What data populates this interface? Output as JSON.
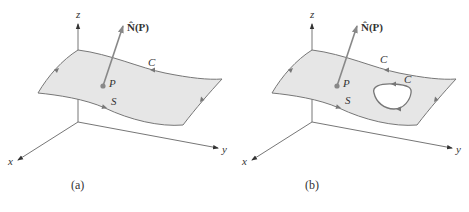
{
  "figures": [
    {
      "id": "a",
      "caption": "(a)",
      "axes": {
        "x": "x",
        "y": "y",
        "z": "z"
      },
      "normal_label": "N̂(P)",
      "point_label": "P",
      "surface_label": "S",
      "boundary_label": "C",
      "inner_boundary_label": null
    },
    {
      "id": "b",
      "caption": "(b)",
      "axes": {
        "x": "x",
        "y": "y",
        "z": "z"
      },
      "normal_label": "N̂(P)",
      "point_label": "P",
      "surface_label": "S",
      "boundary_label": "C",
      "inner_boundary_label": "C"
    }
  ],
  "colors": {
    "surface_fill": "#e6e6e6",
    "edge": "#777777",
    "axis": "#666666",
    "arrow": "#888888",
    "text": "#333333",
    "hole": "#ffffff"
  }
}
